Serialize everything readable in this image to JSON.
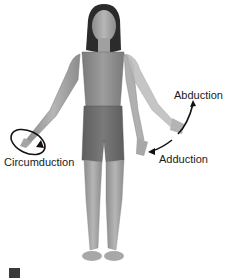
{
  "figure": {
    "style": "grayscale-anatomical-illustration",
    "labels": {
      "abduction": "Abduction",
      "adduction": "Adduction",
      "circumduction": "Circumduction"
    },
    "colors": {
      "skin": "#a9a9a9",
      "skin_shadow": "#8a8a8a",
      "top": "#8e8e8e",
      "shorts": "#6e6e6e",
      "hair": "#2b2b2b",
      "arrow": "#111111",
      "text": "#1a1a1a"
    },
    "icons": [
      "curved-arrow-icon",
      "circular-arrow-icon"
    ]
  }
}
